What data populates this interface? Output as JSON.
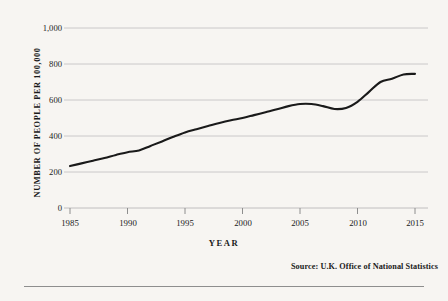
{
  "chart_data": {
    "type": "line",
    "title": "",
    "xlabel": "YEAR",
    "ylabel": "NUMBER OF PEOPLE PER 100,000",
    "xlim": [
      1985,
      2015
    ],
    "ylim": [
      0,
      1000
    ],
    "grid": "horizontal",
    "legend": "none",
    "x_ticks": [
      "1985",
      "1990",
      "1995",
      "2000",
      "2005",
      "2010",
      "2015"
    ],
    "x_tick_values": [
      1985,
      1990,
      1995,
      2000,
      2005,
      2010,
      2015
    ],
    "y_ticks": [
      "0",
      "200",
      "400",
      "600",
      "800",
      "1,000"
    ],
    "y_tick_values": [
      0,
      200,
      400,
      600,
      800,
      1000
    ],
    "series": [
      {
        "name": "Number of people per 100,000",
        "color": "#1a1a1a",
        "x": [
          1985,
          1986,
          1987,
          1988,
          1989,
          1990,
          1991,
          1992,
          1993,
          1994,
          1995,
          1996,
          1997,
          1998,
          1999,
          2000,
          2001,
          2002,
          2003,
          2004,
          2005,
          2006,
          2007,
          2008,
          2009,
          2010,
          2011,
          2012,
          2013,
          2014,
          2015
        ],
        "values": [
          233,
          248,
          263,
          278,
          295,
          310,
          320,
          345,
          370,
          396,
          420,
          438,
          455,
          472,
          487,
          500,
          516,
          532,
          548,
          566,
          578,
          578,
          566,
          550,
          556,
          590,
          645,
          700,
          718,
          742,
          745
        ]
      }
    ],
    "annotations": []
  },
  "source": {
    "text": "Source: U.K. Office of National Statistics"
  }
}
